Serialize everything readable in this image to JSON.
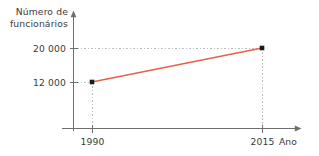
{
  "chart_data": {
    "type": "line",
    "title": "",
    "subtitle": "",
    "xlabel": "Ano",
    "ylabel": "Número de funcionários",
    "ylabel_line1": "Número de",
    "ylabel_line2": "funcionários",
    "x": [
      1990,
      2015
    ],
    "values": [
      12000,
      20000
    ],
    "series": [
      {
        "name": "Número de funcionários",
        "values": [
          12000,
          20000
        ],
        "color": "#E8604C"
      }
    ],
    "categories": [
      "1990",
      "2015"
    ],
    "x_tick_labels": [
      "1990",
      "2015"
    ],
    "y_tick_labels": [
      "12 000",
      "20 000"
    ],
    "y_tick_values": [
      12000,
      20000
    ],
    "xlim": [
      1983,
      2028
    ],
    "ylim": [
      0,
      24000
    ],
    "grid": true,
    "grid_style": "dashed",
    "legend": "none",
    "legend_position": "none",
    "marker": "square",
    "marker_color": "#1b1b1b",
    "annotations": []
  },
  "colors": {
    "line": "#E8604C",
    "marker": "#1b1b1b",
    "axis": "#6e6e6e",
    "grid": "#bdbdbd",
    "text": "#3a3a3a",
    "background": "#ffffff"
  },
  "axes": {
    "y_axis_name": "vertical-axis",
    "x_axis_name": "horizontal-axis",
    "y_arrow": "up-arrow",
    "x_arrow": "right-arrow"
  },
  "points": [
    {
      "label": "1990",
      "value": "12 000",
      "px": 92,
      "py": 82
    },
    {
      "label": "2015",
      "value": "20 000",
      "px": 262,
      "py": 48
    }
  ]
}
